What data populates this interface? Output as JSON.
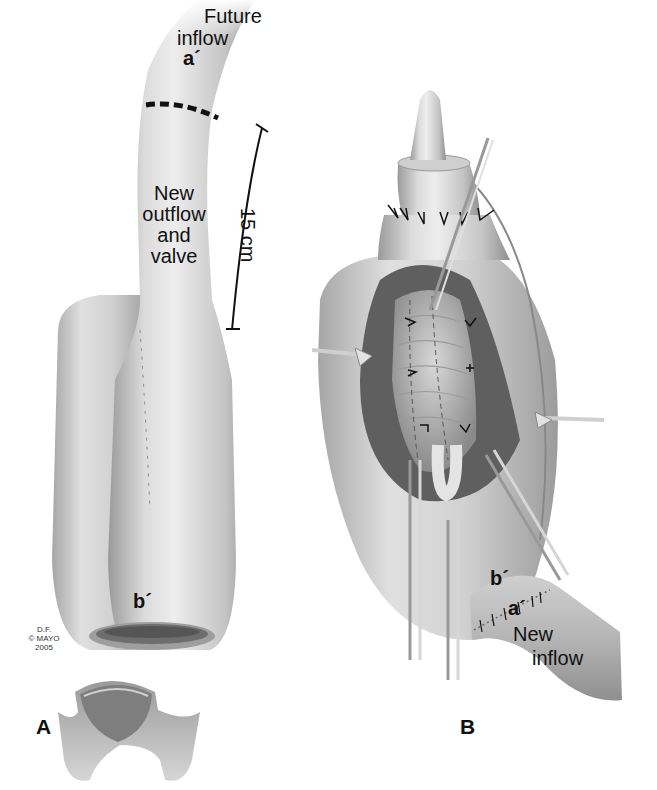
{
  "figure": {
    "panel_a": {
      "letter": "A",
      "future_inflow_line1": "Future",
      "future_inflow_line2": "inflow",
      "marker_top": "a´",
      "body_line1": "New",
      "body_line2": "outflow",
      "body_line3": "and",
      "body_line4": "valve",
      "measurement": "15 cm",
      "marker_bottom": "b´",
      "credit_line1": "D.F.",
      "credit_line2": "© MAYO",
      "credit_line3": "2005"
    },
    "panel_b": {
      "letter": "B",
      "marker_b": "b´",
      "marker_a": "a´",
      "inflow_line1": "New",
      "inflow_line2": "inflow"
    },
    "colors": {
      "tissue_light": "#e6e6e6",
      "tissue_mid": "#bdbdbd",
      "tissue_dark": "#8a8a8a",
      "ink": "#111111"
    }
  }
}
